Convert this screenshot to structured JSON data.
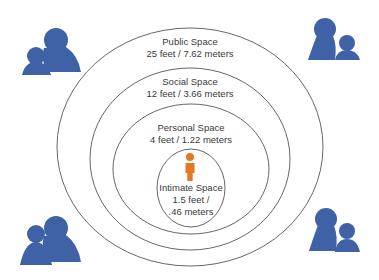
{
  "colors": {
    "ring_stroke": "#555555",
    "people_icon": "#3f62a6",
    "center_person": "#e87722",
    "text": "#3a3a3a"
  },
  "zones": [
    {
      "name": "Public Space",
      "distance": "25 feet / 7.62 meters"
    },
    {
      "name": "Social Space",
      "distance": "12 feet / 3.66 meters"
    },
    {
      "name": "Personal Space",
      "distance": "4 feet / 1.22 meters"
    },
    {
      "name": "Intimate Space",
      "distance_line1": "1.5 feet /",
      "distance_line2": ".46 meters"
    }
  ],
  "icons": {
    "corners": [
      "people-group-icon",
      "people-group-icon",
      "people-group-icon",
      "people-group-icon"
    ],
    "center": "person-icon"
  }
}
